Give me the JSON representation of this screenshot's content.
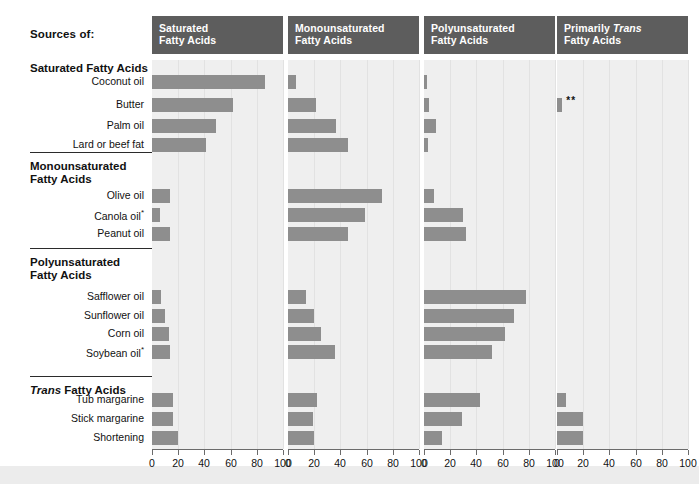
{
  "header": {
    "sources_label": "Sources of:"
  },
  "panels": [
    {
      "id": "saturated",
      "title_line1": "Saturated",
      "title_line2": "Fatty Acids",
      "italic_word": ""
    },
    {
      "id": "monounsaturated",
      "title_line1": "Monounsaturated",
      "title_line2": "Fatty Acids",
      "italic_word": ""
    },
    {
      "id": "polyunsaturated",
      "title_line1": "Polyunsaturated",
      "title_line2": "Fatty Acids",
      "italic_word": ""
    },
    {
      "id": "primarily-trans",
      "title_line1": "Primarily Trans",
      "title_line2": "Fatty Acids",
      "italic_word": "Trans"
    }
  ],
  "groups": [
    {
      "id": "saturated-fatty-acids",
      "heading": "Saturated Fatty Acids",
      "heading_italic": ""
    },
    {
      "id": "monounsaturated-fatty-acids",
      "heading": "Monounsaturated\nFatty Acids",
      "heading_italic": ""
    },
    {
      "id": "polyunsaturated-fatty-acids",
      "heading": "Polyunsaturated\nFatty Acids",
      "heading_italic": ""
    },
    {
      "id": "trans-fatty-acids",
      "heading": "Trans Fatty Acids",
      "heading_italic": "Trans"
    }
  ],
  "rows": [
    {
      "label": "Coconut oil",
      "footnote": ""
    },
    {
      "label": "Butter",
      "footnote": ""
    },
    {
      "label": "Palm oil",
      "footnote": ""
    },
    {
      "label": "Lard or beef fat",
      "footnote": ""
    },
    {
      "label": "Olive oil",
      "footnote": ""
    },
    {
      "label": "Canola oil",
      "footnote": "*"
    },
    {
      "label": "Peanut oil",
      "footnote": ""
    },
    {
      "label": "Safflower oil",
      "footnote": ""
    },
    {
      "label": "Sunflower oil",
      "footnote": ""
    },
    {
      "label": "Corn oil",
      "footnote": ""
    },
    {
      "label": "Soybean oil",
      "footnote": "*"
    },
    {
      "label": "Tub margarine",
      "footnote": ""
    },
    {
      "label": "Stick margarine",
      "footnote": ""
    },
    {
      "label": "Shortening",
      "footnote": ""
    }
  ],
  "annotations": [
    {
      "row": "Butter",
      "panel": "primarily-trans",
      "marker": "**"
    }
  ],
  "colors": {
    "bar": "#8e8e8e",
    "panel_header": "#5d5d5d",
    "panel_body": "#efefef",
    "gridline": "#e2e2e2",
    "axis": "#6b6b6b",
    "text": "#111111",
    "bottom_band": "#ececec"
  },
  "chart_data": {
    "type": "bar",
    "xlabel": "",
    "ylabel": "",
    "xlim": [
      0,
      100
    ],
    "xticks": [
      0,
      20,
      40,
      60,
      80,
      100
    ],
    "grid": true,
    "legend_position": "none",
    "orientation": "horizontal",
    "panels": [
      "Saturated Fatty Acids",
      "Monounsaturated Fatty Acids",
      "Polyunsaturated Fatty Acids",
      "Primarily Trans Fatty Acids"
    ],
    "categories": [
      "Coconut oil",
      "Butter",
      "Palm oil",
      "Lard or beef fat",
      "Olive oil",
      "Canola oil",
      "Peanut oil",
      "Safflower oil",
      "Sunflower oil",
      "Corn oil",
      "Soybean oil",
      "Tub margarine",
      "Stick margarine",
      "Shortening"
    ],
    "series": [
      {
        "name": "Saturated Fatty Acids",
        "values": [
          86,
          62,
          49,
          41,
          14,
          6,
          14,
          7,
          10,
          13,
          14,
          16,
          16,
          20
        ]
      },
      {
        "name": "Monounsaturated Fatty Acids",
        "values": [
          6,
          21,
          37,
          46,
          72,
          59,
          46,
          14,
          20,
          25,
          36,
          22,
          19,
          20
        ]
      },
      {
        "name": "Polyunsaturated Fatty Acids",
        "values": [
          2,
          4,
          9,
          3,
          8,
          30,
          32,
          78,
          69,
          62,
          52,
          43,
          29,
          14
        ]
      },
      {
        "name": "Primarily Trans Fatty Acids",
        "values": [
          0,
          4,
          0,
          0,
          0,
          0,
          0,
          0,
          0,
          0,
          0,
          7,
          20,
          20
        ]
      }
    ]
  }
}
